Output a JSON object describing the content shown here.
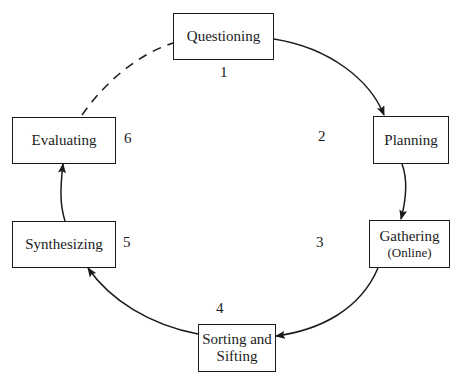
{
  "diagram": {
    "type": "cycle",
    "steps": [
      {
        "number": "1",
        "label": "Questioning",
        "sublabel": ""
      },
      {
        "number": "2",
        "label": "Planning",
        "sublabel": ""
      },
      {
        "number": "3",
        "label": "Gathering",
        "sublabel": "(Online)"
      },
      {
        "number": "4",
        "label": "Sorting and",
        "label2": "Sifting",
        "sublabel": ""
      },
      {
        "number": "5",
        "label": "Synthesizing",
        "sublabel": ""
      },
      {
        "number": "6",
        "label": "Evaluating",
        "sublabel": ""
      }
    ],
    "edges": [
      {
        "from": "Questioning",
        "to": "Planning",
        "style": "solid"
      },
      {
        "from": "Planning",
        "to": "Gathering",
        "style": "solid"
      },
      {
        "from": "Gathering",
        "to": "Sorting and Sifting",
        "style": "solid"
      },
      {
        "from": "Sorting and Sifting",
        "to": "Synthesizing",
        "style": "solid"
      },
      {
        "from": "Synthesizing",
        "to": "Evaluating",
        "style": "solid"
      },
      {
        "from": "Evaluating",
        "to": "Questioning",
        "style": "dashed"
      }
    ]
  }
}
